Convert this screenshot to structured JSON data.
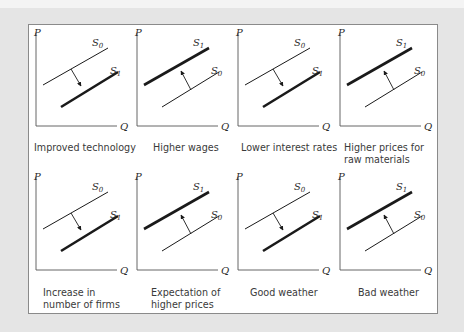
{
  "figure": {
    "axis_labels": {
      "y": "P",
      "x": "Q"
    },
    "curve_labels": {
      "original": "S0",
      "shifted": "S1"
    },
    "panels": [
      {
        "id": "improved-technology",
        "caption": [
          "Improved technology"
        ],
        "shift": "right",
        "direction": "increase"
      },
      {
        "id": "higher-wages",
        "caption": [
          "Higher wages"
        ],
        "shift": "left",
        "direction": "decrease"
      },
      {
        "id": "lower-interest-rates",
        "caption": [
          "Lower interest rates"
        ],
        "shift": "right",
        "direction": "increase"
      },
      {
        "id": "higher-prices-raw-materials",
        "caption": [
          "Higher prices for",
          "raw materials"
        ],
        "shift": "left",
        "direction": "decrease"
      },
      {
        "id": "increase-number-of-firms",
        "caption": [
          "Increase in",
          "number of firms"
        ],
        "shift": "right",
        "direction": "increase"
      },
      {
        "id": "expectation-higher-prices",
        "caption": [
          "Expectation of",
          "higher prices"
        ],
        "shift": "left",
        "direction": "decrease"
      },
      {
        "id": "good-weather",
        "caption": [
          "Good weather"
        ],
        "shift": "right",
        "direction": "increase"
      },
      {
        "id": "bad-weather",
        "caption": [
          "Bad weather"
        ],
        "shift": "left",
        "direction": "decrease"
      }
    ]
  },
  "captions": {
    "p1_l1": "Improved technology",
    "p2_l1": "Higher wages",
    "p3_l1": "Lower interest rates",
    "p4_l1": "Higher prices for",
    "p4_l2": "raw materials",
    "p5_l1": "Increase in",
    "p5_l2": "number of firms",
    "p6_l1": "Expectation of",
    "p6_l2": "higher prices",
    "p7_l1": "Good weather",
    "p8_l1": "Bad weather"
  },
  "colors": {
    "background": "#e5e5e5",
    "frame_border": "#8a8a8a",
    "line": "#1a1a1a",
    "text": "#3a3a3a"
  }
}
